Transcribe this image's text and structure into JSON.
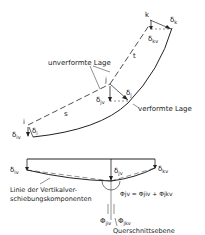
{
  "top_view": {
    "label_undeformed": "unverformte Lage",
    "label_deformed": "verformte Lage",
    "node_i": "i",
    "node_j": "j",
    "node_k": "k",
    "segment_s": "s",
    "segment_t": "t",
    "delta_i": "δ",
    "delta_i_sub": "i",
    "delta_iv": "δ",
    "delta_iv_sub": "iv",
    "delta_j": "δ",
    "delta_j_sub": "j",
    "delta_jv": "δ",
    "delta_jv_sub": "jv",
    "delta_k": "δ",
    "delta_k_sub": "k",
    "delta_kv": "δ",
    "delta_kv_sub": "kv"
  },
  "bottom_view": {
    "delta_iv": "δ",
    "delta_iv_sub": "iv",
    "delta_jv": "δ",
    "delta_jv_sub": "jv",
    "delta_kv": "δ",
    "delta_kv_sub": "kv",
    "line_label_1": "Linie der Vertikalver-",
    "line_label_2": "schiebungskomponenten",
    "phi_formula": "Φjv = Φjiv + Φjkv",
    "phi_jiv": "Φ",
    "phi_jiv_sub": "jiv",
    "phi_jkv": "Φ",
    "phi_jkv_sub": "jkv",
    "cross_section_label": "Querschnittsebene"
  },
  "colors": {
    "line": "#222222",
    "background": "#ffffff"
  }
}
